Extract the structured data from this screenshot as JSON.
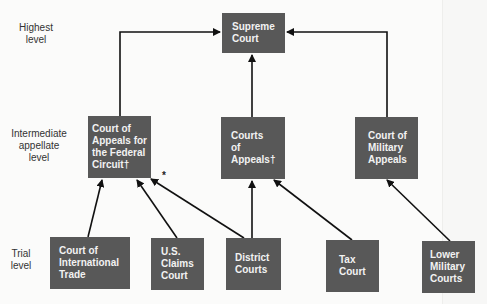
{
  "levels": {
    "highest": "Highest\nlevel",
    "intermediate": "Intermediate\nappellate\nlevel",
    "trial": "Trial\nlevel"
  },
  "courts": {
    "supreme": [
      "Supreme",
      "Court"
    ],
    "federal_circuit": [
      "Court of",
      "Appeals for",
      "the Federal",
      "Circuit†"
    ],
    "appeals": [
      "Courts",
      "of",
      "Appeals†"
    ],
    "military_appeals": [
      "Court of",
      "Military",
      "Appeals"
    ],
    "international_trade": [
      "Court of",
      "International",
      "Trade"
    ],
    "claims": [
      "U.S.",
      "Claims",
      "Court"
    ],
    "district": [
      "District",
      "Courts"
    ],
    "tax": [
      "Tax",
      "Court"
    ],
    "lower_military": [
      "Lower",
      "Military",
      "Courts"
    ]
  },
  "annotation": "*",
  "colors": {
    "box": "#585858",
    "text": "#f2f2f2",
    "arrow": "#111111"
  }
}
